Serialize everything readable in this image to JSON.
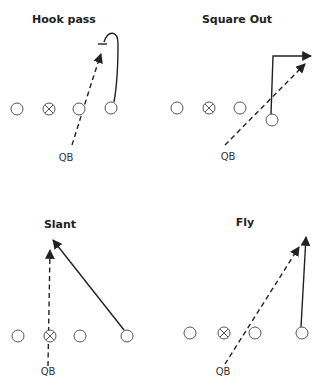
{
  "diagram": {
    "type": "football-pass-plays",
    "colors": {
      "line": "#222222",
      "player_stroke": "#555555",
      "background": "#ffffff"
    },
    "plays": [
      {
        "title": "Hook pass",
        "qb_label": "QB",
        "title_pos": [
          64,
          23
        ],
        "qb_pos": [
          66,
          161
        ],
        "players": [
          {
            "x": 17,
            "y": 109,
            "type": "o"
          },
          {
            "x": 49,
            "y": 109,
            "type": "x"
          },
          {
            "x": 79,
            "y": 109,
            "type": "o"
          },
          {
            "x": 111,
            "y": 108,
            "type": "o"
          }
        ],
        "route": "M114,102 C118,80 118,58 118,44 C118,30 108,30 104,42",
        "route_bar": [
          98,
          44,
          107,
          44
        ],
        "pass": "M72,145 C80,120 92,80 102,52",
        "pass_arrow": [
          102,
          46
        ]
      },
      {
        "title": "Square Out",
        "qb_label": "QB",
        "title_pos": [
          237,
          23
        ],
        "qb_pos": [
          228,
          160
        ],
        "players": [
          {
            "x": 177,
            "y": 108,
            "type": "o"
          },
          {
            "x": 209,
            "y": 108,
            "type": "x"
          },
          {
            "x": 240,
            "y": 108,
            "type": "o"
          },
          {
            "x": 272,
            "y": 120,
            "type": "o"
          }
        ],
        "route": "M271,114 L273,56 L306,56",
        "route_arrow": [
          313,
          56
        ],
        "pass": "M225,145 L302,66",
        "pass_arrow": [
          307,
          62
        ]
      },
      {
        "title": "Slant",
        "qb_label": "QB",
        "title_pos": [
          60,
          228
        ],
        "qb_pos": [
          48,
          375
        ],
        "players": [
          {
            "x": 18,
            "y": 336,
            "type": "o"
          },
          {
            "x": 50,
            "y": 336,
            "type": "x"
          },
          {
            "x": 80,
            "y": 336,
            "type": "o"
          },
          {
            "x": 127,
            "y": 336,
            "type": "o"
          }
        ],
        "route": "M124,330 L56,244",
        "route_arrow": [
          51,
          238
        ],
        "pass": "M48,366 L50,255",
        "pass_arrow": [
          50,
          248
        ]
      },
      {
        "title": "Fly",
        "qb_label": "QB",
        "title_pos": [
          245,
          226
        ],
        "qb_pos": [
          223,
          375
        ],
        "players": [
          {
            "x": 190,
            "y": 333,
            "type": "o"
          },
          {
            "x": 224,
            "y": 333,
            "type": "x"
          },
          {
            "x": 255,
            "y": 333,
            "type": "o"
          },
          {
            "x": 302,
            "y": 333,
            "type": "o"
          }
        ],
        "route": "M301,327 L306,242",
        "route_arrow": [
          307,
          235
        ],
        "pass": "M225,364 L296,251",
        "pass_arrow": [
          300,
          245
        ]
      }
    ]
  }
}
